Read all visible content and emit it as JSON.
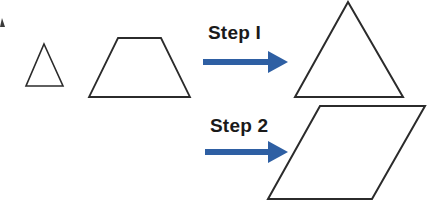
{
  "canvas": {
    "width": 434,
    "height": 204,
    "background": "#ffffff"
  },
  "colors": {
    "outline": "#2b2b2b",
    "arrow": "#2e5fa3",
    "text": "#1a1a1a",
    "background": "#ffffff"
  },
  "labels": {
    "step1": "Step I",
    "step2": "Step 2"
  },
  "shapes": {
    "small_triangle": {
      "name": "small-triangle",
      "points": "44,44 63,86 26,86",
      "stroke_width": 1.6
    },
    "trapezoid": {
      "name": "trapezoid",
      "points": "118,38 161,38 190,97 89,97",
      "stroke_width": 1.8
    },
    "large_triangle": {
      "name": "large-triangle",
      "points": "348,2 403,97 295,97",
      "stroke_width": 2.0
    },
    "parallelogram": {
      "name": "parallelogram",
      "points": "320,106 425,106 372,199 268,199",
      "stroke_width": 2.0
    }
  },
  "arrows": {
    "step1_arrow": {
      "name": "step1-arrow",
      "x_start": 203,
      "x_end": 288,
      "y": 62,
      "shaft_thickness": 6,
      "head_length": 20,
      "head_half_height": 11
    },
    "step2_arrow": {
      "name": "step2-arrow",
      "x_start": 205,
      "x_end": 288,
      "y": 152,
      "shaft_thickness": 6,
      "head_length": 20,
      "head_half_height": 11
    }
  },
  "fragment": {
    "name": "left-edge-clipped-mark",
    "description": "clipped dark mark at the left border"
  }
}
